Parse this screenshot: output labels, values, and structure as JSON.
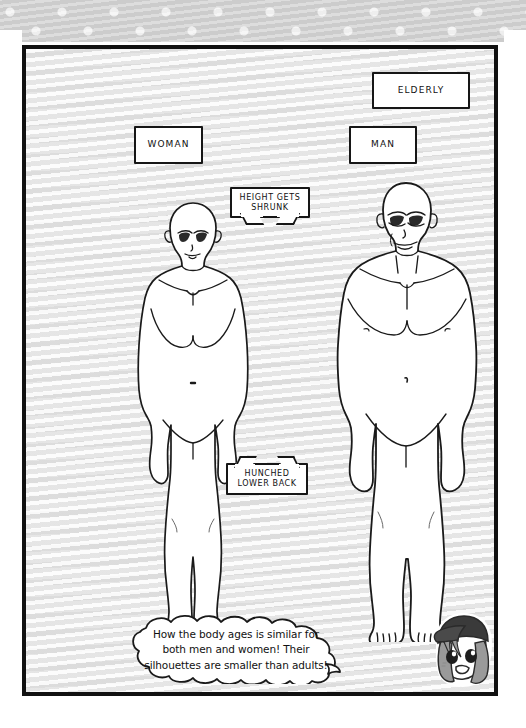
{
  "page": {
    "panel_background": "#f4f4f4",
    "border_color": "#111111",
    "band_color": "#cfcfcf",
    "dot_color": "#f2f2f2"
  },
  "labels": {
    "elderly": "ELDERLY",
    "woman": "WOMAN",
    "man": "MAN"
  },
  "callouts": {
    "height": "HEIGHT GETS\nSHRUNK",
    "height_line1": "HEIGHT GETS",
    "height_line2": "SHRUNK",
    "hunched_line1": "HUNCHED",
    "hunched_line2": "LOWER BACK"
  },
  "caption": {
    "line1": "How the body ages is similar for",
    "line2": "both men and women! Their",
    "line3": "silhouettes are smaller than adults!"
  },
  "figures": {
    "woman": {
      "name": "elderly woman silhouette",
      "pose": "standing front view, arms at sides"
    },
    "man": {
      "name": "elderly man silhouette",
      "pose": "standing front view, arms at sides"
    }
  },
  "avatar": {
    "name": "chibi mascot with cap",
    "cap_color": "#3a3a3a",
    "hair_color": "#9a9a9a",
    "skin_color": "#ffffff"
  }
}
